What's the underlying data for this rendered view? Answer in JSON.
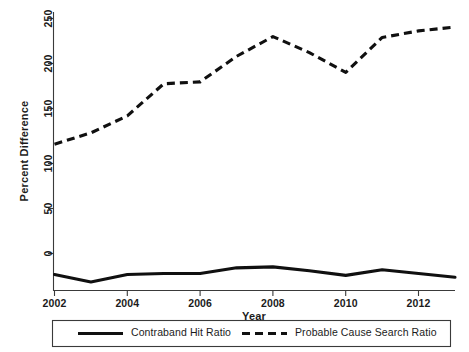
{
  "chart_data": {
    "type": "line",
    "title": "",
    "xlabel": "Year",
    "ylabel": "Percent Difference",
    "x": [
      2002,
      2003,
      2004,
      2005,
      2006,
      2007,
      2008,
      2009,
      2010,
      2011,
      2012,
      2013
    ],
    "xlim": [
      2002,
      2013
    ],
    "ylim": [
      -30,
      265
    ],
    "xticks": [
      2002,
      2004,
      2006,
      2008,
      2010,
      2012
    ],
    "xtick_labels": [
      "2002",
      "2004",
      "2006",
      "2008",
      "2010",
      "2012"
    ],
    "yticks": [
      0,
      50,
      100,
      150,
      200,
      250
    ],
    "ytick_labels": [
      "0",
      "50",
      "100",
      "150",
      "200",
      "250"
    ],
    "grid": false,
    "legend_position": "below-axes",
    "series": [
      {
        "name": "Contraband Hit Ratio",
        "style": "solid",
        "color": "#101010",
        "values": [
          -13,
          -21,
          -13,
          -12,
          -12,
          -6,
          -5,
          -9,
          -14,
          -8,
          -12,
          -16
        ]
      },
      {
        "name": "Probable Cause Search Ratio",
        "style": "dashed",
        "color": "#101010",
        "values": [
          125,
          137,
          155,
          189,
          191,
          218,
          239,
          222,
          201,
          238,
          245,
          249
        ]
      }
    ]
  },
  "axes": {
    "y_axis_title": "Percent Difference",
    "x_axis_title": "Year"
  },
  "legend": {
    "entries": [
      {
        "label": "Contraband Hit Ratio",
        "style": "solid"
      },
      {
        "label": "Probable Cause Search Ratio",
        "style": "dashed"
      }
    ]
  }
}
